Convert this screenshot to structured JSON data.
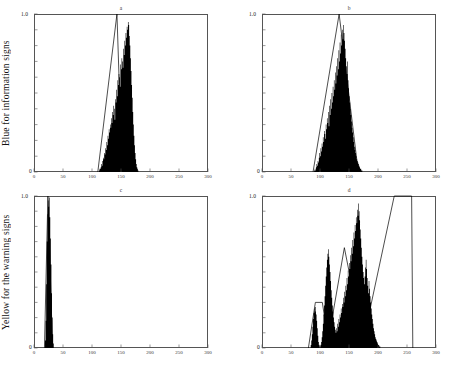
{
  "figure": {
    "row_labels": [
      "Blue for information signs",
      "Yellow for the warning signs"
    ]
  },
  "chart_data": [
    {
      "id": "top-left",
      "type": "bar",
      "title": "a",
      "row_label": "Blue for information signs",
      "xlabel": "",
      "ylabel": "",
      "xlim": [
        0,
        300
      ],
      "ylim": [
        0,
        1.0
      ],
      "xticks": [
        0,
        50,
        100,
        150,
        200,
        250,
        300
      ],
      "xticklabels": [
        "0",
        "50",
        "100",
        "150",
        "200",
        "250",
        "300"
      ],
      "yticks": [
        0,
        1.0
      ],
      "yticklabels": [
        "0",
        "1.0"
      ],
      "grid": false,
      "legend": "none",
      "envelope": {
        "shape": "triangle",
        "points": [
          [
            110,
            0
          ],
          [
            143,
            1.0
          ],
          [
            152,
            0
          ]
        ]
      },
      "histogram": {
        "bin_start": 112,
        "bin_width": 1,
        "values": [
          0.01,
          0.02,
          0.02,
          0.03,
          0.05,
          0.04,
          0.07,
          0.09,
          0.08,
          0.12,
          0.11,
          0.15,
          0.14,
          0.19,
          0.17,
          0.23,
          0.21,
          0.27,
          0.25,
          0.3,
          0.28,
          0.34,
          0.31,
          0.38,
          0.36,
          0.42,
          0.4,
          0.33,
          0.46,
          0.44,
          0.52,
          0.48,
          0.58,
          0.55,
          0.62,
          0.6,
          0.54,
          0.68,
          0.65,
          0.72,
          0.7,
          0.66,
          0.78,
          0.74,
          0.83,
          0.8,
          0.88,
          0.85,
          0.92,
          0.9,
          0.95,
          0.93,
          0.86,
          0.8,
          0.72,
          0.64,
          0.55,
          0.47,
          0.38,
          0.3,
          0.23,
          0.17,
          0.12,
          0.08,
          0.05,
          0.03,
          0.02,
          0.01
        ]
      }
    },
    {
      "id": "top-right",
      "type": "bar",
      "title": "b",
      "row_label": "Blue for information signs",
      "xlabel": "",
      "ylabel": "",
      "xlim": [
        0,
        300
      ],
      "ylim": [
        0,
        1.0
      ],
      "xticks": [
        0,
        50,
        100,
        150,
        200,
        250,
        300
      ],
      "xticklabels": [
        "0",
        "50",
        "100",
        "150",
        "200",
        "250",
        "300"
      ],
      "yticks": [
        0,
        1.0
      ],
      "yticklabels": [
        "0",
        "1.0"
      ],
      "grid": false,
      "legend": "none",
      "envelope": {
        "shape": "triangle",
        "points": [
          [
            88,
            0
          ],
          [
            133,
            1.0
          ],
          [
            166,
            0
          ]
        ]
      },
      "histogram": {
        "bin_start": 90,
        "bin_width": 1,
        "values": [
          0.01,
          0.02,
          0.01,
          0.03,
          0.05,
          0.04,
          0.07,
          0.06,
          0.09,
          0.12,
          0.1,
          0.15,
          0.13,
          0.18,
          0.16,
          0.22,
          0.19,
          0.26,
          0.24,
          0.21,
          0.3,
          0.27,
          0.34,
          0.31,
          0.38,
          0.29,
          0.42,
          0.36,
          0.46,
          0.4,
          0.5,
          0.44,
          0.54,
          0.48,
          0.58,
          0.52,
          0.63,
          0.56,
          0.67,
          0.61,
          0.72,
          0.65,
          0.77,
          0.7,
          0.82,
          0.75,
          0.87,
          0.8,
          0.9,
          0.84,
          0.93,
          0.88,
          0.83,
          0.78,
          0.72,
          0.67,
          0.62,
          0.7,
          0.58,
          0.53,
          0.48,
          0.44,
          0.4,
          0.36,
          0.32,
          0.28,
          0.25,
          0.22,
          0.19,
          0.16,
          0.14,
          0.12,
          0.1,
          0.08,
          0.07,
          0.06,
          0.05,
          0.04,
          0.03,
          0.02,
          0.02,
          0.01,
          0.01
        ]
      }
    },
    {
      "id": "bottom-left",
      "type": "bar",
      "title": "c",
      "row_label": "Yellow for the warning signs",
      "xlabel": "",
      "ylabel": "",
      "xlim": [
        0,
        300
      ],
      "ylim": [
        0,
        1.0
      ],
      "xticks": [
        0,
        50,
        100,
        150,
        200,
        250,
        300
      ],
      "xticklabels": [
        "0",
        "50",
        "100",
        "150",
        "200",
        "250",
        "300"
      ],
      "yticks": [
        0,
        1.0
      ],
      "yticklabels": [
        "0",
        "1.0"
      ],
      "grid": false,
      "legend": "none",
      "envelope": {
        "shape": "triangle",
        "points": [
          [
            18,
            0
          ],
          [
            24,
            1.0
          ],
          [
            32,
            0
          ]
        ]
      },
      "histogram": {
        "bin_start": 19,
        "bin_width": 1,
        "values": [
          0.05,
          0.18,
          0.42,
          0.7,
          0.88,
          0.97,
          0.93,
          0.99,
          0.86,
          0.72,
          0.55,
          0.36,
          0.2,
          0.09,
          0.03
        ]
      }
    },
    {
      "id": "bottom-right",
      "type": "bar",
      "title": "d",
      "row_label": "Yellow for the warning signs",
      "xlabel": "",
      "ylabel": "",
      "xlim": [
        0,
        300
      ],
      "ylim": [
        0,
        1.0
      ],
      "xticks": [
        0,
        50,
        100,
        150,
        200,
        250,
        300
      ],
      "xticklabels": [
        "0",
        "50",
        "100",
        "150",
        "200",
        "250",
        "300"
      ],
      "yticks": [
        0,
        1.0
      ],
      "yticklabels": [
        "0",
        "1.0"
      ],
      "grid": false,
      "legend": "none",
      "envelopes": [
        {
          "shape": "trapezoid",
          "points": [
            [
              80,
              0
            ],
            [
              92,
              0.3
            ],
            [
              104,
              0.3
            ],
            [
              116,
              0
            ]
          ]
        },
        {
          "shape": "triangle",
          "points": [
            [
              112,
              0
            ],
            [
              142,
              0.66
            ],
            [
              176,
              0
            ]
          ]
        },
        {
          "shape": "trapezoid",
          "points": [
            [
              172,
              0
            ],
            [
              228,
              1.0
            ],
            [
              258,
              1.0
            ],
            [
              260,
              0
            ]
          ]
        }
      ],
      "histogram": {
        "bin_start": 84,
        "bin_width": 1,
        "values": [
          0.02,
          0.05,
          0.09,
          0.14,
          0.19,
          0.23,
          0.26,
          0.24,
          0.27,
          0.22,
          0.18,
          0.13,
          0.08,
          0.04,
          0.02,
          0.01,
          0.01,
          0.02,
          0.04,
          0.07,
          0.11,
          0.16,
          0.22,
          0.28,
          0.34,
          0.41,
          0.47,
          0.53,
          0.58,
          0.62,
          0.65,
          0.6,
          0.55,
          0.5,
          0.44,
          0.38,
          0.33,
          0.28,
          0.24,
          0.2,
          0.17,
          0.14,
          0.12,
          0.1,
          0.13,
          0.11,
          0.16,
          0.14,
          0.19,
          0.17,
          0.22,
          0.2,
          0.26,
          0.23,
          0.29,
          0.27,
          0.33,
          0.3,
          0.37,
          0.34,
          0.41,
          0.38,
          0.46,
          0.42,
          0.51,
          0.47,
          0.56,
          0.52,
          0.61,
          0.57,
          0.66,
          0.62,
          0.71,
          0.67,
          0.76,
          0.72,
          0.81,
          0.77,
          0.86,
          0.82,
          0.91,
          0.87,
          0.95,
          0.9,
          0.84,
          0.78,
          0.72,
          0.66,
          0.6,
          0.55,
          0.5,
          0.46,
          0.42,
          0.47,
          0.53,
          0.58,
          0.52,
          0.46,
          0.41,
          0.36,
          0.44,
          0.39,
          0.34,
          0.3,
          0.26,
          0.22,
          0.19,
          0.16,
          0.13,
          0.11,
          0.09,
          0.07,
          0.06,
          0.05,
          0.04,
          0.03,
          0.02,
          0.02,
          0.01,
          0.01
        ]
      }
    }
  ]
}
